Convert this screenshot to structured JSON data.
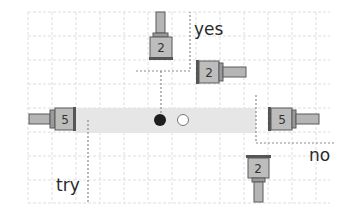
{
  "diagram": {
    "title": "",
    "labels": {
      "yes": "yes",
      "no": "no",
      "try": "try"
    },
    "pieces": [
      {
        "id": "piece-left",
        "number": "5",
        "orientation": "stem-left"
      },
      {
        "id": "piece-top",
        "number": "2",
        "orientation": "stem-up"
      },
      {
        "id": "piece-yes",
        "number": "2",
        "orientation": "stem-right"
      },
      {
        "id": "piece-right",
        "number": "5",
        "orientation": "stem-right"
      },
      {
        "id": "piece-bottom",
        "number": "2",
        "orientation": "stem-down"
      }
    ],
    "markers": [
      {
        "id": "filled-dot",
        "style": "filled"
      },
      {
        "id": "empty-dot",
        "style": "hollow"
      }
    ],
    "colors": {
      "grid": "#dcdcdc",
      "band": "#e6e6e6",
      "piece_fill": "#b3b3b3",
      "piece_edge": "#5a5a5a",
      "dotted": "#888888",
      "dot_filled": "#1e1e1e",
      "text": "#2a2a2a"
    }
  }
}
